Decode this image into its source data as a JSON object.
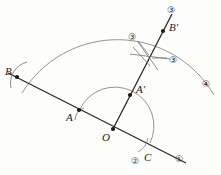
{
  "figure": {
    "background_color": "#fdfdfc",
    "ink_color": "#2b2b2b",
    "arc_color": "#6e6e6e",
    "width": 221,
    "height": 175
  },
  "points": [
    {
      "key": "B",
      "label": "B",
      "x": 17,
      "y": 77,
      "label_x": 5,
      "label_y": 66
    },
    {
      "key": "A",
      "label": "A",
      "x": 79,
      "y": 110,
      "label_x": 66,
      "label_y": 112
    },
    {
      "key": "O",
      "label": "O",
      "x": 113,
      "y": 129,
      "label_x": 102,
      "label_y": 132
    },
    {
      "key": "Ap",
      "label": "A'",
      "x": 130,
      "y": 95,
      "label_x": 136,
      "label_y": 84
    },
    {
      "key": "Bp",
      "label": "B'",
      "x": 163,
      "y": 31,
      "label_x": 169,
      "label_y": 22
    },
    {
      "key": "C",
      "label": "C",
      "x": 146,
      "y": 152,
      "label_x": 144,
      "label_y": 152
    }
  ],
  "step_labels": [
    {
      "key": "step-1",
      "label": "①",
      "x": 175,
      "y": 155
    },
    {
      "key": "step-2",
      "label": "②",
      "x": 131,
      "y": 157
    },
    {
      "key": "step-3-top",
      "label": "③",
      "x": 167,
      "y": 6
    },
    {
      "key": "step-3-left",
      "label": "③",
      "x": 128,
      "y": 33
    },
    {
      "key": "step-3-right",
      "label": "③",
      "x": 169,
      "y": 56
    },
    {
      "key": "step-4",
      "label": "④",
      "x": 202,
      "y": 80
    }
  ],
  "geometry": {
    "ray_ob_label": "ray through O, A, B",
    "ray_oc_label": "ray through O, A-prime, B-prime",
    "inner_arc_label": "arc A to C centered at O",
    "outer_arc_label": "large arc B to step 4 centered at O",
    "cross_arcs_label": "intersecting compass arcs at B-prime"
  }
}
